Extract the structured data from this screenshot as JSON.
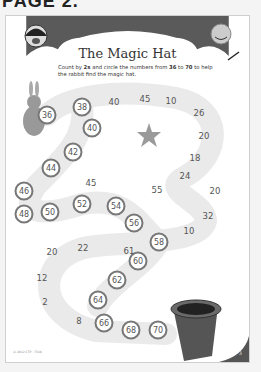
{
  "page_label": "PAGE 2.",
  "worksheet": {
    "title": "The Magic Hat",
    "instructions_parts": [
      "Count by ",
      "2s",
      " and circle the numbers from ",
      "36",
      " to ",
      "70",
      " to help the rabbit find the magic hat."
    ],
    "footer_text": "© 2012 CTP · 7318",
    "page_number": "3"
  },
  "circled_numbers": [
    {
      "v": "36",
      "x": 41,
      "y": 99
    },
    {
      "v": "38",
      "x": 76,
      "y": 91
    },
    {
      "v": "40",
      "x": 86,
      "y": 112
    },
    {
      "v": "42",
      "x": 67,
      "y": 136
    },
    {
      "v": "44",
      "x": 45,
      "y": 152
    },
    {
      "v": "46",
      "x": 18,
      "y": 175
    },
    {
      "v": "48",
      "x": 18,
      "y": 198
    },
    {
      "v": "50",
      "x": 44,
      "y": 196
    },
    {
      "v": "52",
      "x": 76,
      "y": 188
    },
    {
      "v": "54",
      "x": 110,
      "y": 190
    },
    {
      "v": "56",
      "x": 128,
      "y": 207
    },
    {
      "v": "58",
      "x": 153,
      "y": 226
    },
    {
      "v": "60",
      "x": 132,
      "y": 245
    },
    {
      "v": "62",
      "x": 111,
      "y": 264
    },
    {
      "v": "64",
      "x": 92,
      "y": 284
    },
    {
      "v": "66",
      "x": 98,
      "y": 307
    },
    {
      "v": "68",
      "x": 125,
      "y": 314
    },
    {
      "v": "70",
      "x": 152,
      "y": 314
    }
  ],
  "distractor_numbers": [
    {
      "v": "40",
      "x": 108,
      "y": 86
    },
    {
      "v": "45",
      "x": 139,
      "y": 83
    },
    {
      "v": "10",
      "x": 165,
      "y": 85
    },
    {
      "v": "26",
      "x": 193,
      "y": 97
    },
    {
      "v": "20",
      "x": 198,
      "y": 120
    },
    {
      "v": "18",
      "x": 189,
      "y": 142
    },
    {
      "v": "24",
      "x": 179,
      "y": 160
    },
    {
      "v": "20",
      "x": 209,
      "y": 175
    },
    {
      "v": "55",
      "x": 151,
      "y": 174
    },
    {
      "v": "45",
      "x": 85,
      "y": 167
    },
    {
      "v": "32",
      "x": 202,
      "y": 200
    },
    {
      "v": "10",
      "x": 183,
      "y": 215
    },
    {
      "v": "22",
      "x": 77,
      "y": 232
    },
    {
      "v": "61",
      "x": 123,
      "y": 235
    },
    {
      "v": "20",
      "x": 46,
      "y": 236
    },
    {
      "v": "12",
      "x": 36,
      "y": 262
    },
    {
      "v": "2",
      "x": 39,
      "y": 286
    },
    {
      "v": "8",
      "x": 73,
      "y": 305
    }
  ]
}
